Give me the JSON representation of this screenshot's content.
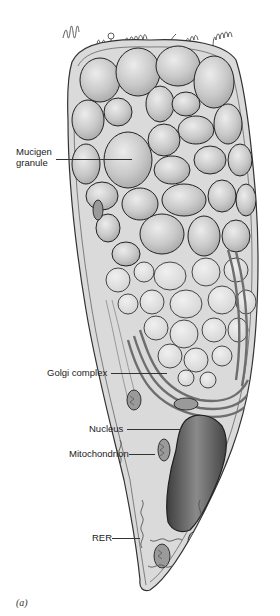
{
  "figure": {
    "top_caption_partial": "SCU·GATLE···COLTS · ···C·L·E··L··I·AL·",
    "panel_label": "(a)",
    "labels": [
      {
        "id": "mucigen",
        "text_line1": "Mucigen",
        "text_line2": "granule"
      },
      {
        "id": "golgi",
        "text": "Golgi complex"
      },
      {
        "id": "nucleus",
        "text": "Nucleus"
      },
      {
        "id": "mitochondrion",
        "text": "Mitochondrion"
      },
      {
        "id": "rer",
        "text": "RER"
      }
    ],
    "colors": {
      "background": "#ffffff",
      "outline": "#3a3a3a",
      "cytoplasm": "#d8d8d8",
      "granule": "#c4c4c4",
      "granule_light": "#e2e2e2",
      "golgi": "#8c8c8c",
      "nucleus": "#5e5e5e",
      "mitochondrion": "#7a7a7a",
      "text": "#222222"
    }
  }
}
